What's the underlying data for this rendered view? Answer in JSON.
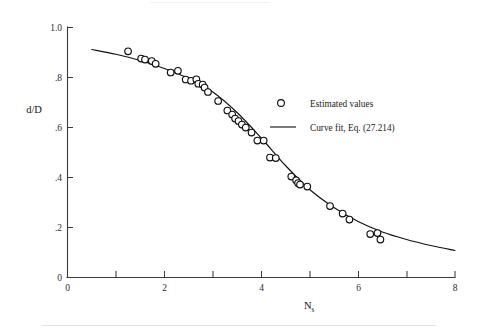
{
  "figure": {
    "background_color": "#ffffff",
    "ink_color": "#121212"
  },
  "chart_data": {
    "type": "scatter",
    "title": "",
    "subtitle": "",
    "xlabel": "N",
    "xlabel_subscript": "s",
    "ylabel": "d/D",
    "xlim": [
      0,
      8
    ],
    "ylim": [
      0,
      1.0
    ],
    "grid": false,
    "x_ticks": [
      0,
      1,
      2,
      3,
      4,
      5,
      6,
      7,
      8
    ],
    "x_tick_labels": [
      "0",
      "",
      "2",
      "",
      "4",
      "",
      "6",
      "",
      "8"
    ],
    "y_ticks": [
      0,
      0.2,
      0.4,
      0.6,
      0.8,
      1.0
    ],
    "y_tick_labels": [
      "0",
      ".2",
      ".4",
      ".6",
      ".8",
      "1.0"
    ],
    "legend_position": "right-upper",
    "series": [
      {
        "name": "Estimated values",
        "type": "scatter",
        "marker": "open-circle",
        "points": [
          [
            1.25,
            0.905
          ],
          [
            1.52,
            0.876
          ],
          [
            1.6,
            0.872
          ],
          [
            1.74,
            0.866
          ],
          [
            1.82,
            0.855
          ],
          [
            2.13,
            0.82
          ],
          [
            2.28,
            0.827
          ],
          [
            2.44,
            0.792
          ],
          [
            2.55,
            0.787
          ],
          [
            2.66,
            0.793
          ],
          [
            2.7,
            0.775
          ],
          [
            2.79,
            0.772
          ],
          [
            2.83,
            0.76
          ],
          [
            2.9,
            0.742
          ],
          [
            3.11,
            0.706
          ],
          [
            3.3,
            0.668
          ],
          [
            3.4,
            0.652
          ],
          [
            3.46,
            0.636
          ],
          [
            3.53,
            0.626
          ],
          [
            3.6,
            0.612
          ],
          [
            3.68,
            0.6
          ],
          [
            3.8,
            0.58
          ],
          [
            3.92,
            0.548
          ],
          [
            4.05,
            0.548
          ],
          [
            4.18,
            0.48
          ],
          [
            4.3,
            0.478
          ],
          [
            4.62,
            0.404
          ],
          [
            4.72,
            0.389
          ],
          [
            4.76,
            0.378
          ],
          [
            4.8,
            0.372
          ],
          [
            4.95,
            0.364
          ],
          [
            5.42,
            0.286
          ],
          [
            5.68,
            0.256
          ],
          [
            5.82,
            0.232
          ],
          [
            6.25,
            0.174
          ],
          [
            6.4,
            0.178
          ],
          [
            6.46,
            0.152
          ]
        ]
      },
      {
        "name": "Curve fit, Eq. (27.214)",
        "type": "line",
        "points": [
          [
            0.5,
            0.912
          ],
          [
            1.0,
            0.893
          ],
          [
            1.5,
            0.868
          ],
          [
            2.0,
            0.836
          ],
          [
            2.5,
            0.796
          ],
          [
            3.0,
            0.742
          ],
          [
            3.5,
            0.66
          ],
          [
            4.0,
            0.558
          ],
          [
            4.5,
            0.448
          ],
          [
            5.0,
            0.352
          ],
          [
            5.5,
            0.28
          ],
          [
            6.0,
            0.224
          ],
          [
            6.5,
            0.182
          ],
          [
            7.0,
            0.152
          ],
          [
            7.5,
            0.128
          ],
          [
            8.0,
            0.108
          ]
        ]
      }
    ]
  },
  "legend": {
    "entries": [
      {
        "label": "Estimated values",
        "marker": "open-circle"
      },
      {
        "label": "Curve fit, Eq. (27.214)",
        "marker": "line"
      }
    ]
  }
}
